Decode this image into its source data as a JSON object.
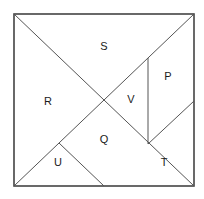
{
  "figure": {
    "name": "tangram-square-dissection",
    "background_color": "#ffffff",
    "stroke_color": "#555555",
    "border_color": "#444444",
    "label_color": "#1a1a1a",
    "canvas": {
      "width": 204,
      "height": 199
    }
  },
  "square": {
    "left": 14,
    "top": 14,
    "right": 194,
    "bottom": 186,
    "stroke_width": 1.6
  },
  "points": {
    "top_left": [
      14,
      14
    ],
    "top_right": [
      194,
      14
    ],
    "bottom_left": [
      14,
      186
    ],
    "bottom_right": [
      194,
      186
    ],
    "center": [
      104,
      100
    ],
    "bottom_center": [
      104,
      186
    ],
    "mid_left_diag": [
      59,
      143
    ],
    "vline_top": [
      148,
      58
    ],
    "vline_bottom": [
      148,
      144
    ],
    "right_edge_mid": [
      194,
      101
    ]
  },
  "lines": [
    {
      "name": "main-diagonal-tl-br",
      "x1": 14,
      "y1": 14,
      "x2": 194,
      "y2": 186
    },
    {
      "name": "anti-diagonal-bl-tr",
      "x1": 14,
      "y1": 186,
      "x2": 194,
      "y2": 14
    },
    {
      "name": "vertical-divider-p-v",
      "x1": 148,
      "y1": 58,
      "x2": 148,
      "y2": 144
    },
    {
      "name": "diagonal-t-upper",
      "x1": 148,
      "y1": 144,
      "x2": 194,
      "y2": 101
    },
    {
      "name": "diagonal-q-u",
      "x1": 59,
      "y1": 143,
      "x2": 104,
      "y2": 186
    }
  ],
  "labels": [
    {
      "id": "S",
      "text": "S",
      "x": 104,
      "y": 47
    },
    {
      "id": "P",
      "text": "P",
      "x": 168,
      "y": 77
    },
    {
      "id": "R",
      "text": "R",
      "x": 48,
      "y": 102
    },
    {
      "id": "V",
      "text": "V",
      "x": 131,
      "y": 100
    },
    {
      "id": "Q",
      "text": "Q",
      "x": 104,
      "y": 140
    },
    {
      "id": "U",
      "text": "U",
      "x": 58,
      "y": 163
    },
    {
      "id": "T",
      "text": "T",
      "x": 164,
      "y": 163
    }
  ]
}
